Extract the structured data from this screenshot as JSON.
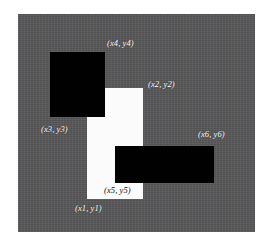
{
  "figure": {
    "background_color": "#ffffff",
    "panel_color": "#58585a",
    "white_shape_color": "#fbfbfb",
    "black_shape_color": "#010101",
    "label_color": "#ffffff"
  },
  "shapes": [
    {
      "name": "white-rectangle",
      "fill": "#fbfbfb",
      "x": 87,
      "y": 88,
      "width": 56,
      "height": 111
    },
    {
      "name": "black-rectangle-upper-left",
      "fill": "#010101",
      "x": 50,
      "y": 52,
      "width": 55,
      "height": 65
    },
    {
      "name": "black-rectangle-lower-right",
      "fill": "#010101",
      "x": 115,
      "y": 146,
      "width": 99,
      "height": 37
    }
  ],
  "labels": [
    {
      "name": "label-x4-y4",
      "text": "(x4, y4)",
      "x": 107,
      "y": 38,
      "color": "#ffffff"
    },
    {
      "name": "label-x2-y2",
      "text": "(x2, y2)",
      "x": 148,
      "y": 79,
      "color": "#ffffff"
    },
    {
      "name": "label-x3-y3",
      "text": "(x3, y3)",
      "x": 41,
      "y": 124,
      "color": "#ffffff"
    },
    {
      "name": "label-x6-y6",
      "text": "(x6, y6)",
      "x": 198,
      "y": 129,
      "color": "#ffffff"
    },
    {
      "name": "label-x5-y5",
      "text": "(x5, y5)",
      "x": 104,
      "y": 185,
      "color": "#111111"
    },
    {
      "name": "label-x1-y1",
      "text": "(x1, y1)",
      "x": 75,
      "y": 203,
      "color": "#ffffff"
    }
  ]
}
